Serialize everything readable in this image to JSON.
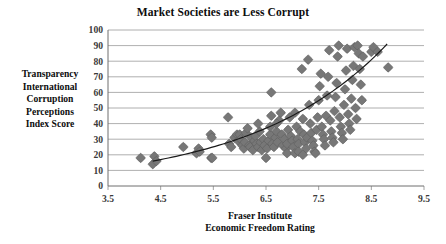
{
  "chart_data": {
    "type": "scatter",
    "title": "Market Societies are Less Corrupt",
    "xlabel": "Fraser Institute\nEconomic Freedom Rating",
    "xlabel_line1": "Fraser Institute",
    "xlabel_line2": "Economic Freedom Rating",
    "ylabel": "Transparency International Corruption Perceptions Index Score",
    "ylabel_line1": "Transparency",
    "ylabel_line2": "International",
    "ylabel_line3": "Corruption",
    "ylabel_line4": "Perceptions",
    "ylabel_line5": "Index Score",
    "xlim": [
      3.5,
      9.5
    ],
    "ylim": [
      0,
      100
    ],
    "xticks": [
      3.5,
      4.5,
      5.5,
      6.5,
      7.5,
      8.5,
      9.5
    ],
    "xtick_labels": [
      "3.5",
      "4.5",
      "5.5",
      "6.5",
      "7.5",
      "8.5",
      "9.5"
    ],
    "yticks": [
      0,
      10,
      20,
      30,
      40,
      50,
      60,
      70,
      80,
      90,
      100
    ],
    "ytick_labels": [
      "0",
      "10",
      "20",
      "30",
      "40",
      "50",
      "60",
      "70",
      "80",
      "90",
      "100"
    ],
    "grid": "horizontal",
    "legend": "none",
    "marker": {
      "shape": "diamond",
      "color": "#777777",
      "edge_color": "#5f5f5f",
      "size_px": 7
    },
    "trendline": {
      "type": "exponential",
      "color": "#1a1a1a",
      "width_px": 1.2,
      "x_start": 4.35,
      "x_end": 8.8,
      "y_start": 16,
      "y_end": 91,
      "description": "Upward-curving exponential fit rising from about 16 at x=4.35 to about 91 at x=8.8"
    },
    "points": [
      [
        4.12,
        18
      ],
      [
        4.35,
        14
      ],
      [
        4.38,
        19
      ],
      [
        4.42,
        16
      ],
      [
        4.93,
        25
      ],
      [
        5.18,
        21
      ],
      [
        5.22,
        24
      ],
      [
        5.24,
        22
      ],
      [
        5.45,
        33
      ],
      [
        5.47,
        31
      ],
      [
        5.46,
        18
      ],
      [
        5.48,
        18
      ],
      [
        5.78,
        44
      ],
      [
        5.8,
        27
      ],
      [
        5.84,
        25
      ],
      [
        5.9,
        31
      ],
      [
        5.95,
        33
      ],
      [
        5.97,
        29
      ],
      [
        6.0,
        33
      ],
      [
        6.02,
        30
      ],
      [
        6.05,
        26
      ],
      [
        6.08,
        24
      ],
      [
        6.1,
        28
      ],
      [
        6.12,
        34
      ],
      [
        6.15,
        37
      ],
      [
        6.18,
        26
      ],
      [
        6.2,
        25
      ],
      [
        6.22,
        31
      ],
      [
        6.25,
        23
      ],
      [
        6.28,
        29
      ],
      [
        6.3,
        32
      ],
      [
        6.32,
        27
      ],
      [
        6.35,
        25
      ],
      [
        6.38,
        35
      ],
      [
        6.4,
        28
      ],
      [
        6.42,
        23
      ],
      [
        6.45,
        30
      ],
      [
        6.47,
        26
      ],
      [
        6.5,
        18
      ],
      [
        6.52,
        24
      ],
      [
        6.55,
        29
      ],
      [
        6.58,
        33
      ],
      [
        6.6,
        60
      ],
      [
        6.62,
        27
      ],
      [
        6.65,
        25
      ],
      [
        6.68,
        31
      ],
      [
        6.7,
        35
      ],
      [
        6.72,
        28
      ],
      [
        6.75,
        42
      ],
      [
        6.78,
        47
      ],
      [
        6.8,
        33
      ],
      [
        6.82,
        26
      ],
      [
        6.85,
        30
      ],
      [
        6.88,
        24
      ],
      [
        6.9,
        27
      ],
      [
        6.92,
        36
      ],
      [
        6.95,
        44
      ],
      [
        6.97,
        32
      ],
      [
        7.0,
        29
      ],
      [
        7.02,
        25
      ],
      [
        7.05,
        47
      ],
      [
        7.08,
        38
      ],
      [
        7.1,
        30
      ],
      [
        7.12,
        27
      ],
      [
        7.15,
        35
      ],
      [
        7.18,
        75
      ],
      [
        7.2,
        43
      ],
      [
        7.22,
        33
      ],
      [
        7.24,
        28
      ],
      [
        7.26,
        24
      ],
      [
        7.28,
        31
      ],
      [
        7.3,
        81
      ],
      [
        7.32,
        52
      ],
      [
        7.34,
        40
      ],
      [
        7.36,
        34
      ],
      [
        7.38,
        29
      ],
      [
        7.4,
        26
      ],
      [
        7.42,
        22
      ],
      [
        7.44,
        21
      ],
      [
        7.46,
        36
      ],
      [
        7.48,
        44
      ],
      [
        7.5,
        55
      ],
      [
        7.52,
        64
      ],
      [
        7.54,
        72
      ],
      [
        7.56,
        38
      ],
      [
        7.58,
        33
      ],
      [
        7.6,
        30
      ],
      [
        7.62,
        26
      ],
      [
        7.64,
        45
      ],
      [
        7.66,
        58
      ],
      [
        7.68,
        70
      ],
      [
        7.7,
        87
      ],
      [
        7.72,
        42
      ],
      [
        7.74,
        35
      ],
      [
        7.76,
        31
      ],
      [
        7.78,
        28
      ],
      [
        7.8,
        48
      ],
      [
        7.82,
        57
      ],
      [
        7.84,
        66
      ],
      [
        7.86,
        83
      ],
      [
        7.88,
        90
      ],
      [
        7.9,
        44
      ],
      [
        7.92,
        38
      ],
      [
        7.94,
        34
      ],
      [
        7.96,
        30
      ],
      [
        7.98,
        52
      ],
      [
        8.0,
        62
      ],
      [
        8.02,
        74
      ],
      [
        8.04,
        88
      ],
      [
        8.06,
        46
      ],
      [
        8.08,
        40
      ],
      [
        8.1,
        36
      ],
      [
        8.12,
        56
      ],
      [
        8.14,
        68
      ],
      [
        8.16,
        77
      ],
      [
        8.18,
        89
      ],
      [
        8.2,
        50
      ],
      [
        8.22,
        43
      ],
      [
        8.24,
        90
      ],
      [
        8.26,
        85
      ],
      [
        8.28,
        75
      ],
      [
        8.3,
        65
      ],
      [
        8.32,
        55
      ],
      [
        8.34,
        83
      ],
      [
        8.5,
        86
      ],
      [
        8.54,
        89
      ],
      [
        8.62,
        86
      ],
      [
        8.82,
        76
      ],
      [
        6.9,
        21
      ],
      [
        7.05,
        21
      ],
      [
        7.12,
        22
      ],
      [
        7.2,
        20
      ],
      [
        6.6,
        45
      ],
      [
        6.7,
        40
      ],
      [
        6.58,
        38
      ],
      [
        6.35,
        40
      ]
    ]
  }
}
